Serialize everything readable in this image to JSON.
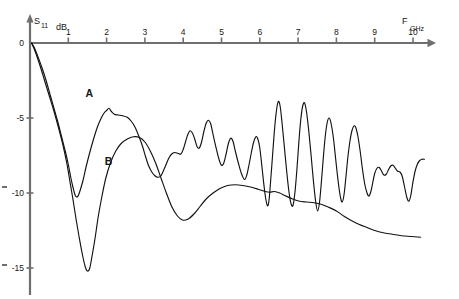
{
  "figure": {
    "name": "s11-return-loss-plot",
    "y_axis_title": "S",
    "y_axis_title_sub": "11",
    "y_axis_unit": "dB",
    "x_axis_title": "F",
    "x_axis_unit": "GHz",
    "background_color": "#ffffff",
    "axis_color": "#6f6f6f",
    "curve_color": "#121212"
  },
  "chart_data": {
    "type": "line",
    "title": "",
    "xlabel": "F GHz",
    "ylabel": "S11 dB",
    "xlim": [
      0,
      10.6
    ],
    "ylim": [
      -16,
      0.5
    ],
    "xticks": [
      1,
      2,
      3,
      4,
      5,
      6,
      7,
      8,
      9,
      10
    ],
    "xtick_labels": [
      "1",
      "2",
      "3",
      "4",
      "5",
      "6",
      "7",
      "8",
      "9",
      "10"
    ],
    "yticks": [
      0,
      -5,
      -10,
      -15
    ],
    "ytick_labels": [
      "0",
      "-5",
      "-10",
      "-15"
    ],
    "grid": false,
    "legend_position": "inline-annotations",
    "annotations": [
      {
        "text": "A",
        "x": 1.55,
        "y": -3.6
      },
      {
        "text": "B",
        "x": 2.05,
        "y": -8.1
      }
    ],
    "series": [
      {
        "name": "A",
        "label": "A",
        "points": [
          [
            0.04,
            0.0
          ],
          [
            0.12,
            -0.35
          ],
          [
            0.22,
            -1.0
          ],
          [
            0.32,
            -1.7
          ],
          [
            0.42,
            -2.5
          ],
          [
            0.52,
            -3.4
          ],
          [
            0.62,
            -4.3
          ],
          [
            0.72,
            -5.2
          ],
          [
            0.82,
            -6.2
          ],
          [
            0.92,
            -7.2
          ],
          [
            1.0,
            -8.1
          ],
          [
            1.06,
            -8.9
          ],
          [
            1.12,
            -9.6
          ],
          [
            1.18,
            -10.15
          ],
          [
            1.24,
            -10.25
          ],
          [
            1.3,
            -9.9
          ],
          [
            1.38,
            -9.2
          ],
          [
            1.46,
            -8.3
          ],
          [
            1.56,
            -7.3
          ],
          [
            1.66,
            -6.4
          ],
          [
            1.76,
            -5.6
          ],
          [
            1.86,
            -5.0
          ],
          [
            1.94,
            -4.65
          ],
          [
            2.0,
            -4.5
          ],
          [
            2.06,
            -4.35
          ],
          [
            2.12,
            -4.55
          ],
          [
            2.2,
            -4.75
          ],
          [
            2.3,
            -4.8
          ],
          [
            2.42,
            -4.85
          ],
          [
            2.54,
            -4.95
          ],
          [
            2.64,
            -5.2
          ],
          [
            2.74,
            -5.6
          ],
          [
            2.84,
            -6.2
          ],
          [
            2.94,
            -6.9
          ],
          [
            3.02,
            -7.6
          ],
          [
            3.1,
            -8.2
          ],
          [
            3.18,
            -8.6
          ],
          [
            3.26,
            -8.85
          ],
          [
            3.34,
            -8.95
          ],
          [
            3.42,
            -8.85
          ],
          [
            3.52,
            -8.3
          ],
          [
            3.62,
            -7.7
          ],
          [
            3.7,
            -7.4
          ],
          [
            3.78,
            -7.3
          ],
          [
            3.86,
            -7.35
          ],
          [
            3.94,
            -7.4
          ],
          [
            4.0,
            -7.1
          ],
          [
            4.06,
            -6.6
          ],
          [
            4.12,
            -6.1
          ],
          [
            4.18,
            -5.85
          ],
          [
            4.24,
            -6.0
          ],
          [
            4.3,
            -6.4
          ],
          [
            4.36,
            -6.9
          ],
          [
            4.42,
            -7.0
          ],
          [
            4.48,
            -6.6
          ],
          [
            4.54,
            -5.9
          ],
          [
            4.6,
            -5.35
          ],
          [
            4.66,
            -5.15
          ],
          [
            4.72,
            -5.4
          ],
          [
            4.78,
            -6.1
          ],
          [
            4.86,
            -7.0
          ],
          [
            4.94,
            -7.8
          ],
          [
            5.0,
            -8.15
          ],
          [
            5.06,
            -8.0
          ],
          [
            5.12,
            -7.4
          ],
          [
            5.18,
            -6.7
          ],
          [
            5.24,
            -6.35
          ],
          [
            5.3,
            -6.55
          ],
          [
            5.36,
            -7.2
          ],
          [
            5.44,
            -8.0
          ],
          [
            5.52,
            -8.7
          ],
          [
            5.6,
            -9.1
          ],
          [
            5.66,
            -8.8
          ],
          [
            5.72,
            -8.1
          ],
          [
            5.78,
            -7.3
          ],
          [
            5.84,
            -6.6
          ],
          [
            5.9,
            -6.25
          ],
          [
            5.95,
            -6.4
          ],
          [
            6.0,
            -7.0
          ],
          [
            6.05,
            -8.1
          ],
          [
            6.1,
            -9.3
          ],
          [
            6.15,
            -10.3
          ],
          [
            6.2,
            -10.85
          ],
          [
            6.24,
            -10.5
          ],
          [
            6.28,
            -9.3
          ],
          [
            6.33,
            -7.6
          ],
          [
            6.38,
            -5.9
          ],
          [
            6.43,
            -4.6
          ],
          [
            6.48,
            -3.9
          ],
          [
            6.53,
            -4.2
          ],
          [
            6.58,
            -5.3
          ],
          [
            6.64,
            -6.9
          ],
          [
            6.7,
            -8.5
          ],
          [
            6.76,
            -9.9
          ],
          [
            6.82,
            -10.75
          ],
          [
            6.87,
            -10.8
          ],
          [
            6.92,
            -9.9
          ],
          [
            6.97,
            -8.4
          ],
          [
            7.02,
            -6.6
          ],
          [
            7.07,
            -5.1
          ],
          [
            7.12,
            -4.2
          ],
          [
            7.17,
            -4.0
          ],
          [
            7.22,
            -4.6
          ],
          [
            7.28,
            -5.9
          ],
          [
            7.34,
            -7.5
          ],
          [
            7.4,
            -9.2
          ],
          [
            7.46,
            -10.6
          ],
          [
            7.51,
            -11.2
          ],
          [
            7.56,
            -10.6
          ],
          [
            7.61,
            -9.2
          ],
          [
            7.66,
            -7.6
          ],
          [
            7.71,
            -6.2
          ],
          [
            7.76,
            -5.3
          ],
          [
            7.81,
            -5.0
          ],
          [
            7.86,
            -5.35
          ],
          [
            7.92,
            -6.3
          ],
          [
            7.98,
            -7.7
          ],
          [
            8.04,
            -9.1
          ],
          [
            8.1,
            -10.2
          ],
          [
            8.15,
            -10.6
          ],
          [
            8.2,
            -10.1
          ],
          [
            8.25,
            -8.9
          ],
          [
            8.3,
            -7.6
          ],
          [
            8.35,
            -6.6
          ],
          [
            8.4,
            -5.9
          ],
          [
            8.45,
            -5.55
          ],
          [
            8.5,
            -5.6
          ],
          [
            8.56,
            -6.2
          ],
          [
            8.62,
            -7.2
          ],
          [
            8.68,
            -8.4
          ],
          [
            8.74,
            -9.4
          ],
          [
            8.8,
            -10.0
          ],
          [
            8.85,
            -10.2
          ],
          [
            8.9,
            -9.9
          ],
          [
            8.95,
            -9.3
          ],
          [
            9.0,
            -8.7
          ],
          [
            9.06,
            -8.35
          ],
          [
            9.12,
            -8.3
          ],
          [
            9.18,
            -8.55
          ],
          [
            9.24,
            -8.8
          ],
          [
            9.3,
            -8.75
          ],
          [
            9.36,
            -8.45
          ],
          [
            9.42,
            -8.2
          ],
          [
            9.48,
            -8.15
          ],
          [
            9.54,
            -8.35
          ],
          [
            9.6,
            -8.55
          ],
          [
            9.66,
            -8.6
          ],
          [
            9.72,
            -8.9
          ],
          [
            9.78,
            -9.6
          ],
          [
            9.84,
            -10.3
          ],
          [
            9.89,
            -10.55
          ],
          [
            9.94,
            -10.2
          ],
          [
            9.99,
            -9.4
          ],
          [
            10.05,
            -8.6
          ],
          [
            10.11,
            -8.1
          ],
          [
            10.17,
            -7.85
          ],
          [
            10.23,
            -7.75
          ],
          [
            10.3,
            -7.75
          ]
        ]
      },
      {
        "name": "B",
        "label": "B",
        "points": [
          [
            0.04,
            0.0
          ],
          [
            0.14,
            -0.6
          ],
          [
            0.26,
            -1.5
          ],
          [
            0.38,
            -2.5
          ],
          [
            0.5,
            -3.5
          ],
          [
            0.62,
            -4.5
          ],
          [
            0.74,
            -5.6
          ],
          [
            0.86,
            -6.8
          ],
          [
            0.96,
            -8.0
          ],
          [
            1.04,
            -9.2
          ],
          [
            1.12,
            -10.4
          ],
          [
            1.2,
            -11.7
          ],
          [
            1.28,
            -12.9
          ],
          [
            1.36,
            -14.0
          ],
          [
            1.44,
            -14.9
          ],
          [
            1.5,
            -15.2
          ],
          [
            1.56,
            -15.0
          ],
          [
            1.62,
            -14.2
          ],
          [
            1.7,
            -13.0
          ],
          [
            1.78,
            -11.6
          ],
          [
            1.88,
            -10.2
          ],
          [
            1.98,
            -9.0
          ],
          [
            2.1,
            -8.0
          ],
          [
            2.24,
            -7.2
          ],
          [
            2.38,
            -6.7
          ],
          [
            2.54,
            -6.4
          ],
          [
            2.7,
            -6.25
          ],
          [
            2.86,
            -6.3
          ],
          [
            3.0,
            -6.6
          ],
          [
            3.14,
            -7.2
          ],
          [
            3.28,
            -8.0
          ],
          [
            3.42,
            -9.0
          ],
          [
            3.56,
            -10.0
          ],
          [
            3.7,
            -10.9
          ],
          [
            3.84,
            -11.5
          ],
          [
            3.98,
            -11.8
          ],
          [
            4.12,
            -11.75
          ],
          [
            4.28,
            -11.4
          ],
          [
            4.44,
            -10.9
          ],
          [
            4.6,
            -10.4
          ],
          [
            4.78,
            -10.0
          ],
          [
            4.96,
            -9.7
          ],
          [
            5.16,
            -9.5
          ],
          [
            5.36,
            -9.45
          ],
          [
            5.56,
            -9.5
          ],
          [
            5.76,
            -9.6
          ],
          [
            5.96,
            -9.75
          ],
          [
            6.14,
            -9.9
          ],
          [
            6.26,
            -9.95
          ],
          [
            6.38,
            -9.9
          ],
          [
            6.52,
            -10.0
          ],
          [
            6.68,
            -10.2
          ],
          [
            6.86,
            -10.4
          ],
          [
            7.04,
            -10.55
          ],
          [
            7.22,
            -10.6
          ],
          [
            7.42,
            -10.65
          ],
          [
            7.6,
            -10.75
          ],
          [
            7.8,
            -10.95
          ],
          [
            8.0,
            -11.2
          ],
          [
            8.2,
            -11.55
          ],
          [
            8.4,
            -11.85
          ],
          [
            8.6,
            -12.1
          ],
          [
            8.8,
            -12.3
          ],
          [
            9.0,
            -12.5
          ],
          [
            9.22,
            -12.65
          ],
          [
            9.46,
            -12.75
          ],
          [
            9.7,
            -12.85
          ],
          [
            9.96,
            -12.9
          ],
          [
            10.2,
            -12.95
          ]
        ]
      }
    ]
  }
}
